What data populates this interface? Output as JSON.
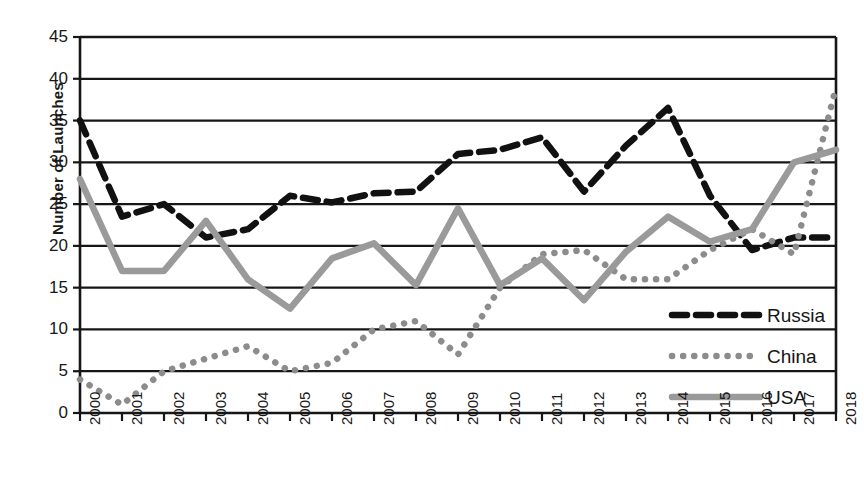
{
  "chart_data": {
    "type": "line",
    "title": "",
    "xlabel": "",
    "ylabel": "Number of Launches",
    "ylim": [
      0,
      45
    ],
    "ytick_step": 5,
    "yticks": [
      0,
      5,
      10,
      15,
      20,
      25,
      30,
      35,
      40,
      45
    ],
    "grid": true,
    "grid_axis": "y",
    "legend_position": "bottom-right",
    "categories": [
      2000,
      2001,
      2002,
      2003,
      2004,
      2005,
      2006,
      2007,
      2008,
      2009,
      2010,
      2011,
      2012,
      2013,
      2014,
      2015,
      2016,
      2017,
      2018
    ],
    "xtick_labels": [
      "2000",
      "2001",
      "2002",
      "2003",
      "2004",
      "2005",
      "2006",
      "2007",
      "2008",
      "2009",
      "2010",
      "2011",
      "2012",
      "2013",
      "2014",
      "2015",
      "2016",
      "2017",
      "2018"
    ],
    "series": [
      {
        "name": "Russia",
        "style": "dashed",
        "color": "#111111",
        "values": [
          35,
          23.5,
          25,
          21,
          22,
          26,
          25.2,
          26.3,
          26.5,
          31,
          31.5,
          33,
          26.5,
          32,
          36.5,
          26,
          19.5,
          21,
          21
        ]
      },
      {
        "name": "China",
        "style": "dotted",
        "color": "#8c8c8c",
        "values": [
          4,
          1,
          5,
          6.5,
          8,
          5,
          6,
          10,
          11,
          7,
          15,
          19,
          19.5,
          16,
          16,
          19.5,
          22,
          19,
          39
        ]
      },
      {
        "name": "USA",
        "style": "solid",
        "color": "#9a9a9a",
        "values": [
          28,
          17,
          17,
          23,
          16,
          12.5,
          18.5,
          20.3,
          15.3,
          24.5,
          15.3,
          18.5,
          13.5,
          19.3,
          23.5,
          20.5,
          22,
          30,
          31.5
        ]
      }
    ]
  },
  "legend": {
    "items": [
      {
        "label": "Russia",
        "swatch": "dashed-line-swatch"
      },
      {
        "label": "China",
        "swatch": "dotted-line-swatch"
      },
      {
        "label": "USA",
        "swatch": "solid-line-swatch"
      }
    ]
  },
  "axis": {
    "y_title": "Number of Launches"
  }
}
